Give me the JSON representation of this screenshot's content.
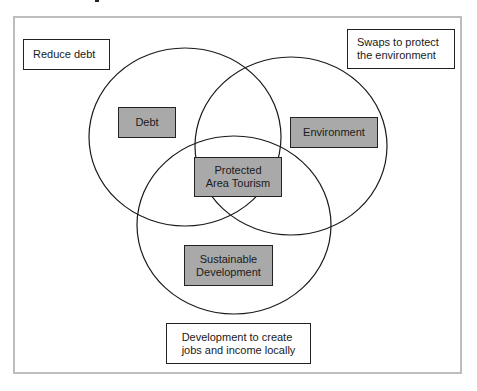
{
  "diagram": {
    "type": "venn",
    "cut_off_title_fragment": "",
    "frame_border_color": "#bdbdbd",
    "set_box_fill": "#a9a9a9",
    "sets": [
      {
        "id": "debt",
        "label": "Debt",
        "goal": "Reduce debt"
      },
      {
        "id": "environment",
        "label": "Environment",
        "goal": "Swaps to protect\nthe environment"
      },
      {
        "id": "sustainable",
        "label": "Sustainable\nDevelopment",
        "goal": "Development to create\njobs and income locally"
      }
    ],
    "intersection": {
      "label": "Protected\nArea Tourism",
      "sets": [
        "debt",
        "environment",
        "sustainable"
      ]
    },
    "labels": {
      "reduce_debt": "Reduce debt",
      "swaps": "Swaps to protect\nthe environment",
      "development": "Development to create\n jobs and income locally",
      "debt": "Debt",
      "environment": "Environment",
      "protected": "Protected\nArea Tourism",
      "sustainable": "Sustainable\nDevelopment"
    }
  }
}
